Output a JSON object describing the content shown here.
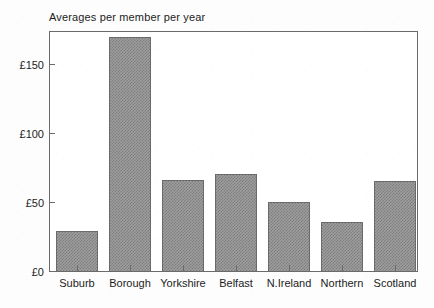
{
  "chart_data": {
    "type": "bar",
    "title": "Averages per member per year",
    "xlabel": "",
    "ylabel": "",
    "categories": [
      "Suburb",
      "Borough",
      "Yorkshire",
      "Belfast",
      "N.Ireland",
      "Northern",
      "Scotland"
    ],
    "values": [
      30,
      171,
      67,
      71,
      51,
      36,
      66
    ],
    "ylim": [
      0,
      175
    ],
    "ytick_values": [
      0,
      50,
      100,
      150
    ],
    "ytick_labels": [
      "£0",
      "£50",
      "£100",
      "£150"
    ],
    "currency_symbol": "£",
    "grid": false,
    "legend": null,
    "bar_fill_color": "#9e9e9e",
    "bar_edge_color": "#6a6a6a",
    "axis_color": "#6b6b6b",
    "background_color": "#ffffff"
  }
}
